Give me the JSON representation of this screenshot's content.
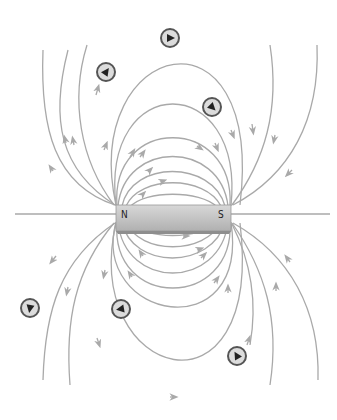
{
  "diagram": {
    "type": "magnetic-field-lines-bar-magnet",
    "magnet": {
      "north_label": "N",
      "south_label": "S",
      "x": 116,
      "y": 205,
      "width": 115,
      "height": 26
    },
    "colors": {
      "field_line": "#a9a9a9",
      "magnet_fill": "#c9c9c9",
      "compass_ring": "#555555",
      "compass_face": "#dcdcdc",
      "needle": "#222222"
    },
    "compasses": [
      {
        "x": 170,
        "y": 38,
        "needle_deg": 0
      },
      {
        "x": 106,
        "y": 72,
        "needle_deg": -60
      },
      {
        "x": 212,
        "y": 107,
        "needle_deg": 45
      },
      {
        "x": 30,
        "y": 308,
        "needle_deg": 100
      },
      {
        "x": 121,
        "y": 309,
        "needle_deg": 170
      },
      {
        "x": 237,
        "y": 356,
        "needle_deg": -120
      }
    ]
  }
}
